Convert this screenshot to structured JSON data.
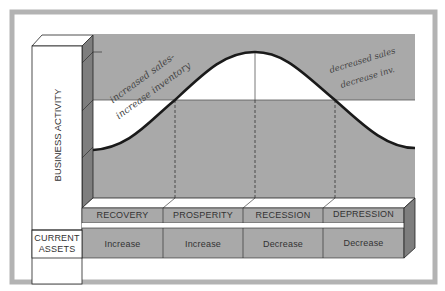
{
  "diagram": {
    "y_axis_label": "BUSINESS ACTIVITY",
    "row_label_line1": "CURRENT",
    "row_label_line2": "ASSETS",
    "phases": [
      {
        "label": "RECOVERY",
        "current_assets": "Increase"
      },
      {
        "label": "PROSPERITY",
        "current_assets": "Increase"
      },
      {
        "label": "RECESSION",
        "current_assets": "Decrease"
      },
      {
        "label": "DEPRESSION",
        "current_assets": "Decrease"
      }
    ],
    "annotations": {
      "left_line1": "increased sales-",
      "left_line2": "increase inventory",
      "right_line1": "decreased sales",
      "right_line2": "decrease inv."
    },
    "colors": {
      "gray": "#a9a9a9",
      "dark_gray": "#7e7e7e",
      "frame": "#b3b3b3",
      "white": "#ffffff",
      "line": "#1a1a1a"
    }
  }
}
